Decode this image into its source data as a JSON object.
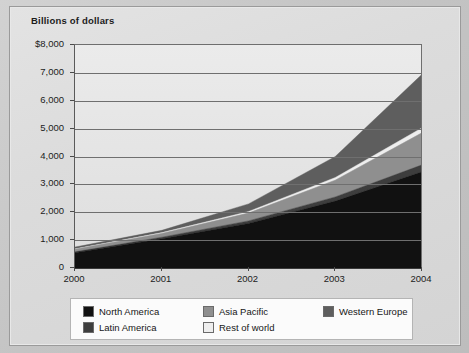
{
  "axis_title": "Billions of dollars",
  "chart_data": {
    "type": "area",
    "title": "Billions of dollars",
    "xlabel": "",
    "ylabel": "Billions of dollars",
    "ylim": [
      0,
      8000
    ],
    "grid": true,
    "stacked": true,
    "legend_position": "bottom",
    "categories": [
      "2000",
      "2001",
      "2002",
      "2003",
      "2004"
    ],
    "x": [
      2000,
      2001,
      2002,
      2003,
      2004
    ],
    "ytick_labels": [
      "$8,000",
      "7,000",
      "6,000",
      "5,000",
      "4,000",
      "3,000",
      "2,000",
      "1,000",
      "0"
    ],
    "ytick_values": [
      8000,
      7000,
      6000,
      5000,
      4000,
      3000,
      2000,
      1000,
      0
    ],
    "xtick_labels": [
      "2000",
      "2001",
      "2002",
      "2003",
      "2004"
    ],
    "series": [
      {
        "name": "North America",
        "color": "#111111",
        "values": [
          550,
          1050,
          1600,
          2400,
          3450
        ]
      },
      {
        "name": "Latin America",
        "color": "#3d3d3d",
        "values": [
          30,
          55,
          90,
          150,
          250
        ]
      },
      {
        "name": "Asia Pacific",
        "color": "#8f8f8f",
        "values": [
          90,
          130,
          280,
          600,
          1150
        ]
      },
      {
        "name": "Rest of world",
        "color": "#eeeeee",
        "values": [
          20,
          35,
          60,
          100,
          180
        ]
      },
      {
        "name": "Western Europe",
        "color": "#5e5e5e",
        "values": [
          60,
          80,
          270,
          750,
          1920
        ]
      }
    ],
    "stack_tops": {
      "north_america": [
        550,
        1050,
        1600,
        2400,
        3450
      ],
      "latin_america": [
        580,
        1105,
        1690,
        2550,
        3700
      ],
      "asia_pacific": [
        670,
        1235,
        1970,
        3150,
        4850
      ],
      "rest_of_world": [
        690,
        1270,
        2030,
        3250,
        5030
      ],
      "western_europe": [
        750,
        1350,
        2300,
        4000,
        6950
      ]
    },
    "totals": [
      750,
      1350,
      2300,
      4000,
      6950
    ]
  },
  "legend": {
    "items": [
      {
        "label": "North America",
        "color": "#111111"
      },
      {
        "label": "Asia Pacific",
        "color": "#8f8f8f"
      },
      {
        "label": "Western Europe",
        "color": "#5e5e5e"
      },
      {
        "label": "Latin America",
        "color": "#3d3d3d"
      },
      {
        "label": "Rest of world",
        "color": "#eeeeee"
      }
    ]
  }
}
